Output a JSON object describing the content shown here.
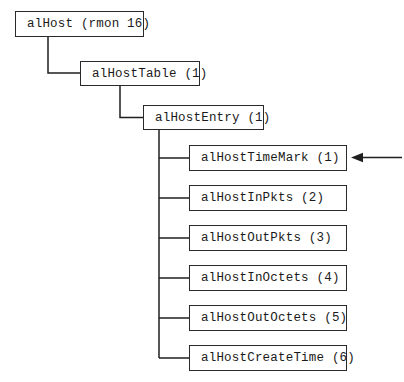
{
  "diagram": {
    "nodes": [
      {
        "label": "alHost (rmon 16)",
        "level": 0
      },
      {
        "label": "alHostTable (1)",
        "level": 1
      },
      {
        "label": "alHostEntry (1)",
        "level": 2
      },
      {
        "label": "alHostTimeMark (1)",
        "level": 3,
        "annotated_by_arrow": true
      },
      {
        "label": "alHostInPkts (2)",
        "level": 3
      },
      {
        "label": "alHostOutPkts (3)",
        "level": 3
      },
      {
        "label": "alHostInOctets (4)",
        "level": 3
      },
      {
        "label": "alHostOutOctets (5)",
        "level": 3
      },
      {
        "label": "alHostCreateTime (6)",
        "level": 3
      }
    ],
    "icons": [
      {
        "name": "pointer-arrow-icon",
        "meaning": "arrow pointing left at alHostTimeMark (1)"
      }
    ],
    "colors": {
      "background": "#ffffff",
      "line": "#1f1f1f",
      "box_border": "#2a2a2a",
      "box_fill": "#ffffff",
      "text": "#1a1a1a"
    }
  }
}
